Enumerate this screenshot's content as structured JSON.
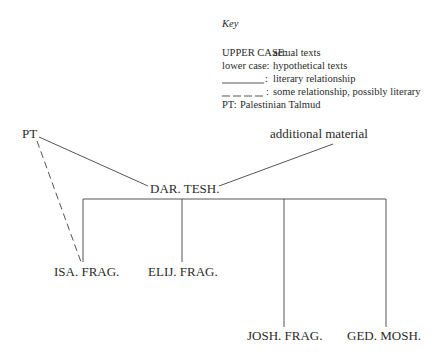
{
  "key": {
    "title": "Key",
    "entries": [
      {
        "term": "UPPER CASE:",
        "meaning": "actual texts"
      },
      {
        "term": "lower case:",
        "meaning": "hypothetical texts"
      },
      {
        "term": "___________:",
        "meaning": "literary relationship",
        "line_style": "solid"
      },
      {
        "term": "__ __ __ __ :",
        "meaning": "some relationship, possibly literary",
        "line_style": "dashed"
      },
      {
        "term": "PT:",
        "meaning": "Palestinian Talmud"
      }
    ]
  },
  "nodes": {
    "pt": "PT",
    "additional_material": "additional material",
    "dar_tesh": "DAR. TESH.",
    "isa_frag": "ISA. FRAG.",
    "elij_frag": "ELIJ. FRAG.",
    "josh_frag": "JOSH. FRAG.",
    "ged_mosh": "GED. MOSH."
  },
  "edges": [
    {
      "from": "PT",
      "to": "DAR. TESH.",
      "style": "solid"
    },
    {
      "from": "additional material",
      "to": "DAR. TESH.",
      "style": "solid"
    },
    {
      "from": "PT",
      "to": "ISA. FRAG.",
      "style": "dashed"
    },
    {
      "from": "DAR. TESH.",
      "to": "ISA. FRAG.",
      "style": "solid"
    },
    {
      "from": "DAR. TESH.",
      "to": "ELIJ. FRAG.",
      "style": "solid"
    },
    {
      "from": "DAR. TESH.",
      "to": "JOSH. FRAG.",
      "style": "solid"
    },
    {
      "from": "DAR. TESH.",
      "to": "GED. MOSH.",
      "style": "solid"
    }
  ],
  "colors": {
    "line": "#555555",
    "text": "#2a2a2a",
    "background": "#ffffff"
  }
}
